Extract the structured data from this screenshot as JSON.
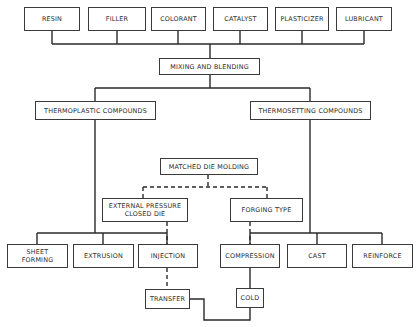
{
  "ingredients": {
    "resin": "RESIN",
    "filler": "FILLER",
    "colorant": "COLORANT",
    "catalyst": "CATALYST",
    "plasticizer": "PLASTICIZER",
    "lubricant": "LUBRICANT"
  },
  "process": {
    "mixing": "MIXING AND BLENDING"
  },
  "compounds": {
    "thermoplastic": "THERMOPLASTIC COMPOUNDS",
    "thermosetting": "THERMOSETTING COMPOUNDS"
  },
  "molding": {
    "matched_die": "MATCHED DIE MOLDING",
    "external_pressure": "EXTERNAL PRESSURE\nCLOSED DIE",
    "forging_type": "FORGING TYPE"
  },
  "methods": {
    "sheet_forming": "SHEET\nFORMING",
    "extrusion": "EXTRUSION",
    "injection": "INJECTION",
    "compression": "COMPRESSION",
    "cast": "CAST",
    "reinforce": "REINFORCE"
  },
  "sub_methods": {
    "transfer": "TRANSFER",
    "cold": "COLD"
  },
  "colors": {
    "line": "#2a2a2a",
    "box_border": "#3a3a3a",
    "background": "#ffffff"
  }
}
